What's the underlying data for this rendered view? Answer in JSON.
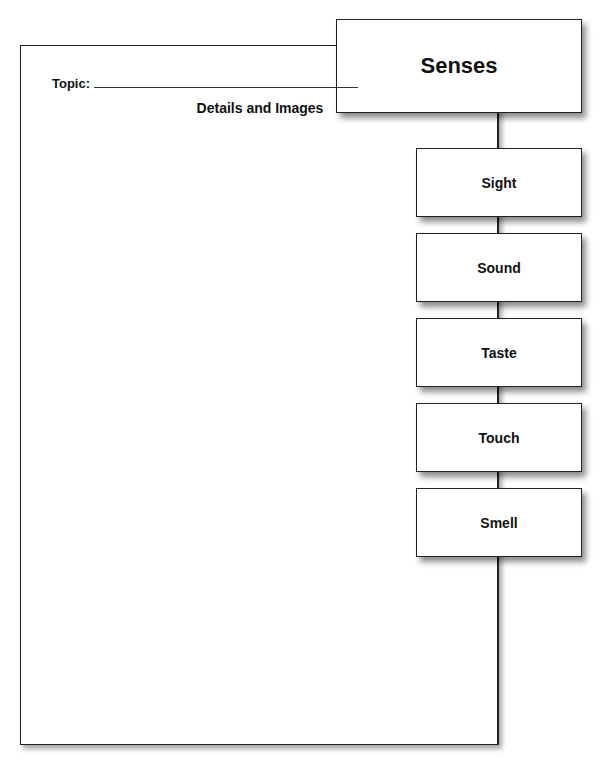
{
  "title_box": {
    "label": "Senses"
  },
  "topic": {
    "label": "Topic:",
    "value": ""
  },
  "details_heading": "Details and Images",
  "senses": [
    {
      "label": "Sight"
    },
    {
      "label": "Sound"
    },
    {
      "label": "Taste"
    },
    {
      "label": "Touch"
    },
    {
      "label": "Smell"
    }
  ]
}
